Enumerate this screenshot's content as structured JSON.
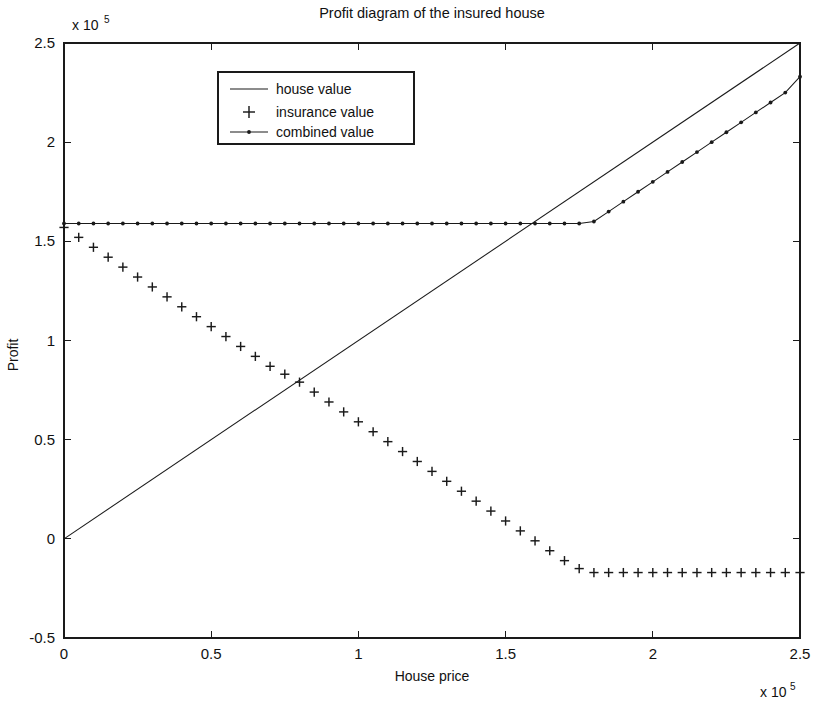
{
  "chart_data": {
    "type": "line",
    "title": "Profit diagram of the insured house",
    "xlabel": "House price",
    "ylabel": "Profit",
    "x_exponent_label": "x 10",
    "x_exponent_power": "5",
    "y_exponent_label": "x 10",
    "y_exponent_power": "5",
    "xlim": [
      0,
      250000
    ],
    "ylim": [
      -50000,
      250000
    ],
    "xticks": [
      0,
      50000,
      100000,
      150000,
      200000,
      250000
    ],
    "xtick_labels": [
      "0",
      "0.5",
      "1",
      "1.5",
      "2",
      "2.5"
    ],
    "yticks": [
      -50000,
      0,
      50000,
      100000,
      150000,
      200000,
      250000
    ],
    "ytick_labels": [
      "-0.5",
      "0",
      "0.5",
      "1",
      "1.5",
      "2",
      "2.5"
    ],
    "grid": false,
    "legend_position": "top-center-left",
    "box": true,
    "series": [
      {
        "name": "house value",
        "style": "solid-line",
        "marker": "none",
        "color": "#1a1a1a",
        "x": [
          0,
          250000
        ],
        "y": [
          0,
          250000
        ],
        "description": "Straight line of slope 1 from origin to 2.5e5"
      },
      {
        "name": "insurance value",
        "style": "markers-only",
        "marker": "plus",
        "color": "#1a1a1a",
        "x": [
          0,
          5000,
          10000,
          15000,
          20000,
          25000,
          30000,
          35000,
          40000,
          45000,
          50000,
          55000,
          60000,
          65000,
          70000,
          75000,
          80000,
          85000,
          90000,
          95000,
          100000,
          105000,
          110000,
          115000,
          120000,
          125000,
          130000,
          135000,
          140000,
          145000,
          150000,
          155000,
          160000,
          165000,
          170000,
          175000,
          180000,
          185000,
          190000,
          195000,
          200000,
          205000,
          210000,
          215000,
          220000,
          225000,
          230000,
          235000,
          240000,
          245000,
          250000
        ],
        "y": [
          157000,
          152000,
          147000,
          142000,
          137000,
          132000,
          127000,
          122000,
          117000,
          112000,
          107000,
          102000,
          97000,
          92000,
          87000,
          83000,
          79000,
          74000,
          69000,
          64000,
          59000,
          54000,
          49000,
          44000,
          39000,
          34000,
          29000,
          24000,
          19000,
          14000,
          9000,
          4000,
          -1000,
          -6000,
          -11000,
          -15000,
          -17000,
          -17000,
          -17000,
          -17000,
          -17000,
          -17000,
          -17000,
          -17000,
          -17000,
          -17000,
          -17000,
          -17000,
          -17000,
          -17000,
          -17000
        ],
        "description": "Declines linearly from 1.57e5 at x=0 to a floor of about -0.17e5 reached near x=1.8e5, then flat"
      },
      {
        "name": "combined value",
        "style": "line-with-markers",
        "marker": "dot",
        "color": "#1a1a1a",
        "x": [
          0,
          5000,
          10000,
          15000,
          20000,
          25000,
          30000,
          35000,
          40000,
          45000,
          50000,
          55000,
          60000,
          65000,
          70000,
          75000,
          80000,
          85000,
          90000,
          95000,
          100000,
          105000,
          110000,
          115000,
          120000,
          125000,
          130000,
          135000,
          140000,
          145000,
          150000,
          155000,
          160000,
          165000,
          170000,
          175000,
          180000,
          185000,
          190000,
          195000,
          200000,
          205000,
          210000,
          215000,
          220000,
          225000,
          230000,
          235000,
          240000,
          245000,
          250000
        ],
        "y": [
          159000,
          159000,
          159000,
          159000,
          159000,
          159000,
          159000,
          159000,
          159000,
          159000,
          159000,
          159000,
          159000,
          159000,
          159000,
          159000,
          159000,
          159000,
          159000,
          159000,
          159000,
          159000,
          159000,
          159000,
          159000,
          159000,
          159000,
          159000,
          159000,
          159000,
          159000,
          159000,
          159000,
          159000,
          159000,
          159000,
          160000,
          165000,
          170000,
          175000,
          180000,
          185000,
          190000,
          195000,
          200000,
          205000,
          210000,
          215000,
          220000,
          225000,
          233000
        ],
        "description": "Flat at about 1.59e5 up to x≈1.78e5 then rises with slope 1 to about 2.33e5"
      }
    ]
  },
  "legend": {
    "entries": [
      {
        "label": "house value",
        "glyph": "line"
      },
      {
        "label": "insurance value",
        "glyph": "plus"
      },
      {
        "label": "combined value",
        "glyph": "line-dot"
      }
    ]
  },
  "colors": {
    "ink": "#1a1a1a",
    "background": "#ffffff"
  }
}
